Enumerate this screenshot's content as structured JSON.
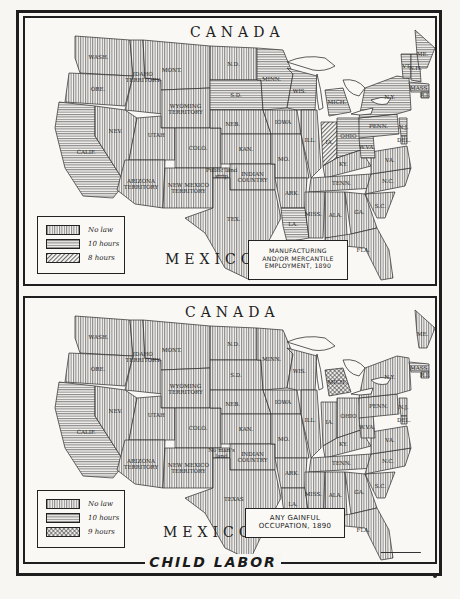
{
  "title": "CHILD LABOR",
  "patterns": {
    "no_law": "vertical-lines",
    "ten_hours": "horizontal-lines",
    "eight_hours": "diagonal-lines",
    "nine_hours": "crosshatch"
  },
  "colors": {
    "ink": "#1e1e1e",
    "paper": "#f9f8f5"
  },
  "maps": [
    {
      "id": "top",
      "country_north": "CANADA",
      "country_south": "MEXICO",
      "caption": [
        "MANUFACTURING",
        "AND/OR MERCANTILE",
        "EMPLOYMENT, 1890"
      ],
      "legend": [
        {
          "pattern": "no_law",
          "label": "No law"
        },
        {
          "pattern": "ten_hours",
          "label": "10 hours"
        },
        {
          "pattern": "eight_hours",
          "label": "8 hours"
        }
      ],
      "states": [
        {
          "label": "WASH.",
          "law": "no_law"
        },
        {
          "label": "ORE.",
          "law": "no_law"
        },
        {
          "label": "CALIF.",
          "law": "ten_hours"
        },
        {
          "label": "IDAHO TERRITORY",
          "law": "no_law"
        },
        {
          "label": "NEV.",
          "law": "no_law"
        },
        {
          "label": "MONT.",
          "law": "no_law"
        },
        {
          "label": "WYOMING TERRITORY",
          "law": "no_law"
        },
        {
          "label": "UTAH",
          "law": "no_law"
        },
        {
          "label": "COLO.",
          "law": "no_law"
        },
        {
          "label": "ARIZONA TERRITORY",
          "law": "no_law"
        },
        {
          "label": "NEW MEXICO TERRITORY",
          "law": "no_law"
        },
        {
          "label": "N.D.",
          "law": "no_law"
        },
        {
          "label": "S.D.",
          "law": "ten_hours"
        },
        {
          "label": "NEB.",
          "law": "no_law"
        },
        {
          "label": "KAN.",
          "law": "no_law"
        },
        {
          "label": "Public land strip",
          "law": "no_law"
        },
        {
          "label": "INDIAN COUNTRY",
          "law": "no_law"
        },
        {
          "label": "TEX.",
          "law": "no_law"
        },
        {
          "label": "MINN.",
          "law": "ten_hours"
        },
        {
          "label": "IOWA",
          "law": "no_law"
        },
        {
          "label": "MO.",
          "law": "no_law"
        },
        {
          "label": "ARK.",
          "law": "no_law"
        },
        {
          "label": "LA.",
          "law": "ten_hours"
        },
        {
          "label": "WIS.",
          "law": "ten_hours"
        },
        {
          "label": "ILL.",
          "law": "no_law"
        },
        {
          "label": "MICH.",
          "law": "ten_hours"
        },
        {
          "label": "IA.",
          "law": "eight_hours"
        },
        {
          "label": "OHIO",
          "law": "ten_hours"
        },
        {
          "label": "KY.",
          "law": "no_law"
        },
        {
          "label": "TENN.",
          "law": "no_law"
        },
        {
          "label": "MISS.",
          "law": "no_law"
        },
        {
          "label": "ALA.",
          "law": "no_law"
        },
        {
          "label": "GA.",
          "law": "no_law"
        },
        {
          "label": "FLA.",
          "law": "no_law"
        },
        {
          "label": "S.C.",
          "law": "no_law"
        },
        {
          "label": "N.C.",
          "law": "no_law"
        },
        {
          "label": "VA.",
          "law": "no_law"
        },
        {
          "label": "W.VA.",
          "law": "ten_hours"
        },
        {
          "label": "PENN.",
          "law": "ten_hours"
        },
        {
          "label": "N.Y.",
          "law": "ten_hours"
        },
        {
          "label": "N.J.",
          "law": "ten_hours"
        },
        {
          "label": "DEL.",
          "law": "no_law"
        },
        {
          "label": "VT.",
          "law": "ten_hours"
        },
        {
          "label": "N.H.",
          "law": "ten_hours"
        },
        {
          "label": "ME.",
          "law": "ten_hours"
        },
        {
          "label": "MASS.",
          "law": "ten_hours"
        },
        {
          "label": "R.I.",
          "law": "ten_hours"
        }
      ]
    },
    {
      "id": "bottom",
      "country_north": "CANADA",
      "country_south": "MEXICO",
      "caption": [
        "ANY GAINFUL",
        "OCCUPATION, 1890"
      ],
      "legend": [
        {
          "pattern": "no_law",
          "label": "No law"
        },
        {
          "pattern": "ten_hours",
          "label": "10 hours"
        },
        {
          "pattern": "nine_hours",
          "label": "9 hours"
        }
      ],
      "states": [
        {
          "label": "WASH.",
          "law": "no_law"
        },
        {
          "label": "ORE.",
          "law": "no_law"
        },
        {
          "label": "CALIF.",
          "law": "ten_hours"
        },
        {
          "label": "IDAHO TERRITORY",
          "law": "no_law"
        },
        {
          "label": "NEV.",
          "law": "no_law"
        },
        {
          "label": "MONT.",
          "law": "no_law"
        },
        {
          "label": "WYOMING TERRITORY",
          "law": "no_law"
        },
        {
          "label": "UTAH",
          "law": "no_law"
        },
        {
          "label": "COLO.",
          "law": "no_law"
        },
        {
          "label": "ARIZONA TERRITORY",
          "law": "no_law"
        },
        {
          "label": "NEW MEXICO TERRITORY",
          "law": "no_law"
        },
        {
          "label": "N.D.",
          "law": "no_law"
        },
        {
          "label": "S.D.",
          "law": "no_law"
        },
        {
          "label": "NEB.",
          "law": "no_law"
        },
        {
          "label": "KAN.",
          "law": "no_law"
        },
        {
          "label": "No man's land",
          "law": "no_law"
        },
        {
          "label": "INDIAN COUNTRY",
          "law": "no_law"
        },
        {
          "label": "TEXAS",
          "law": "no_law"
        },
        {
          "label": "MINN.",
          "law": "no_law"
        },
        {
          "label": "IOWA",
          "law": "no_law"
        },
        {
          "label": "MO.",
          "law": "no_law"
        },
        {
          "label": "ARK.",
          "law": "no_law"
        },
        {
          "label": "LA.",
          "law": "no_law"
        },
        {
          "label": "WIS.",
          "law": "no_law"
        },
        {
          "label": "ILL.",
          "law": "no_law"
        },
        {
          "label": "MICH.",
          "law": "nine_hours"
        },
        {
          "label": "IA.",
          "law": "no_law"
        },
        {
          "label": "OHIO",
          "law": "no_law"
        },
        {
          "label": "KY.",
          "law": "no_law"
        },
        {
          "label": "TENN.",
          "law": "no_law"
        },
        {
          "label": "MISS.",
          "law": "no_law"
        },
        {
          "label": "ALA.",
          "law": "no_law"
        },
        {
          "label": "GA.",
          "law": "no_law"
        },
        {
          "label": "FLA.",
          "law": "no_law"
        },
        {
          "label": "S.C.",
          "law": "no_law"
        },
        {
          "label": "N.C.",
          "law": "no_law"
        },
        {
          "label": "VA.",
          "law": "no_law"
        },
        {
          "label": "W.VA.",
          "law": "no_law"
        },
        {
          "label": "PENN.",
          "law": "no_law"
        },
        {
          "label": "N.Y.",
          "law": "no_law"
        },
        {
          "label": "N.J.",
          "law": "no_law"
        },
        {
          "label": "DEL.",
          "law": "no_law"
        },
        {
          "label": "ME.",
          "law": "no_law"
        },
        {
          "label": "MASS.",
          "law": "ten_hours"
        },
        {
          "label": "R.I.",
          "law": "no_law"
        }
      ]
    }
  ]
}
